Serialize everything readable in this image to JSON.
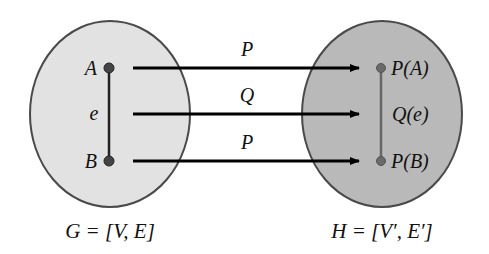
{
  "diagram": {
    "left_graph": {
      "caption": "G = [V, E]",
      "fill": "#e2e2e2",
      "nodes": [
        {
          "label": "A"
        },
        {
          "label": "B"
        }
      ],
      "edge_label": "e"
    },
    "right_graph": {
      "caption": "H = [V′, E′]",
      "fill": "#b9b9b9",
      "nodes": [
        {
          "label": "P(A)"
        },
        {
          "label": "P(B)"
        }
      ],
      "edge_label": "Q(e)"
    },
    "mappings": [
      {
        "label": "P",
        "from": "A",
        "to": "P(A)"
      },
      {
        "label": "Q",
        "from": "e",
        "to": "Q(e)"
      },
      {
        "label": "P",
        "from": "B",
        "to": "P(B)"
      }
    ]
  }
}
